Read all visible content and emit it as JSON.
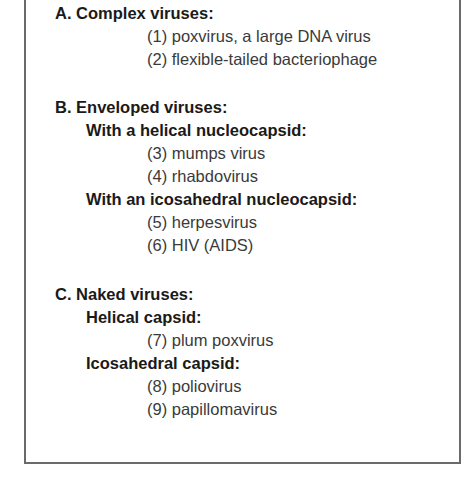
{
  "sections": [
    {
      "heading": "A. Complex viruses:",
      "items": [
        "(1) poxvirus, a large DNA virus",
        "(2) flexible-tailed bacteriophage"
      ]
    },
    {
      "heading": "B. Enveloped viruses:",
      "subsections": [
        {
          "heading": "With a helical nucleocapsid:",
          "items": [
            "(3) mumps virus",
            "(4) rhabdovirus"
          ]
        },
        {
          "heading": "With an icosahedral nucleocapsid:",
          "items": [
            "(5) herpesvirus",
            "(6) HIV (AIDS)"
          ]
        }
      ]
    },
    {
      "heading": "C. Naked viruses:",
      "subsections": [
        {
          "heading": "Helical capsid:",
          "items": [
            "(7) plum poxvirus"
          ]
        },
        {
          "heading": "Icosahedral capsid:",
          "items": [
            "(8) poliovirus",
            "(9) papillomavirus"
          ]
        }
      ]
    }
  ]
}
